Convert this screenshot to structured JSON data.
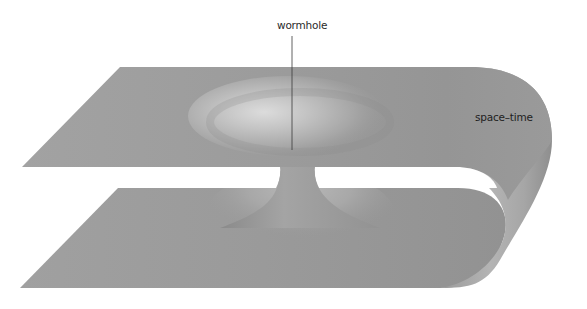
{
  "diagram": {
    "labels": {
      "wormhole": "wormhole",
      "spacetime": "space–time"
    },
    "colors": {
      "background": "#ffffff",
      "sheet_base": "#9a9a9a",
      "sheet_light": "#c8c8c8",
      "sheet_dark": "#808080",
      "highlight": "#dedede",
      "leader_line": "#3a3a3a",
      "label_text": "#2a2a2a"
    },
    "elements": [
      {
        "name": "upper-sheet",
        "description": "flat upper space-time sheet with funnel depression"
      },
      {
        "name": "lower-sheet",
        "description": "flat lower space-time sheet"
      },
      {
        "name": "fold",
        "description": "curved fold connecting upper and lower sheets on the right"
      },
      {
        "name": "throat",
        "description": "wormhole throat connecting the two sheets"
      }
    ]
  }
}
